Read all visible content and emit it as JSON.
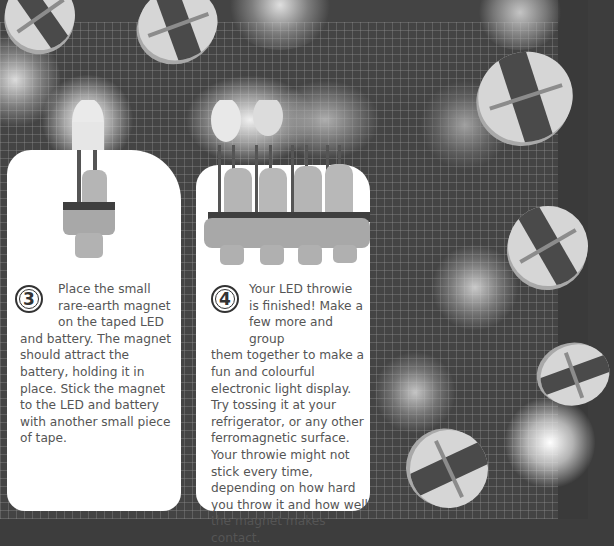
{
  "page": {
    "colors": {
      "background": "#444444",
      "grid": "#969696",
      "card": "#ffffff",
      "text": "#555555",
      "badge": "#333333"
    },
    "steps": [
      {
        "number": "3",
        "intro_lines": [
          "Place the small",
          "rare-earth magnet",
          "on the taped LED"
        ],
        "body": "and battery. The magnet should attract the battery, holding it in place. Stick the magnet to the LED and battery with another small piece of tape.",
        "illustration": "single-led-throwie-with-magnet"
      },
      {
        "number": "4",
        "intro_lines": [
          "Your LED throwie",
          "is finished! Make a",
          "few more and group"
        ],
        "body": "them together to make a fun and colourful electronic light display. Try tossing it at your refrigerator, or any other ferromagnetic surface. Your throwie might not stick every time, depending on how hard you throw it and how well the magnet makes contact.",
        "illustration": "four-led-throwies-grouped"
      }
    ],
    "background_illustration": "glowing-led-throwies-on-grid"
  }
}
